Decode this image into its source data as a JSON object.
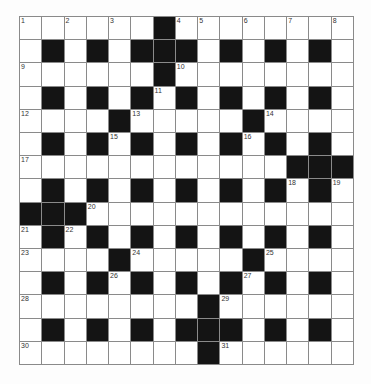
{
  "puzzle": {
    "type": "crossword",
    "rows": 15,
    "cols": 15,
    "colors": {
      "black_cell": "#141414",
      "white_cell": "#ffffff",
      "grid_line": "#8a8a8a",
      "number": "#333333"
    },
    "black_cells": {
      "0": [
        6
      ],
      "1": [
        1,
        3,
        5,
        6,
        7,
        9,
        11,
        13
      ],
      "2": [
        6
      ],
      "3": [
        1,
        3,
        5,
        7,
        9,
        11,
        13
      ],
      "4": [
        4,
        10
      ],
      "5": [
        1,
        3,
        5,
        7,
        9,
        11,
        13
      ],
      "6": [
        12,
        13,
        14
      ],
      "7": [
        1,
        3,
        5,
        7,
        9,
        11,
        13
      ],
      "8": [
        0,
        1,
        2
      ],
      "9": [
        1,
        3,
        5,
        7,
        9,
        11,
        13
      ],
      "10": [
        4,
        10
      ],
      "11": [
        1,
        3,
        5,
        7,
        9,
        11,
        13
      ],
      "12": [
        8
      ],
      "13": [
        1,
        3,
        5,
        7,
        8,
        9,
        11,
        13
      ],
      "14": [
        8
      ]
    },
    "numbers": [
      {
        "n": "1",
        "r": 0,
        "c": 0
      },
      {
        "n": "2",
        "r": 0,
        "c": 2
      },
      {
        "n": "3",
        "r": 0,
        "c": 4
      },
      {
        "n": "4",
        "r": 0,
        "c": 7
      },
      {
        "n": "5",
        "r": 0,
        "c": 8
      },
      {
        "n": "6",
        "r": 0,
        "c": 10
      },
      {
        "n": "7",
        "r": 0,
        "c": 12
      },
      {
        "n": "8",
        "r": 0,
        "c": 14
      },
      {
        "n": "9",
        "r": 2,
        "c": 0
      },
      {
        "n": "10",
        "r": 2,
        "c": 7
      },
      {
        "n": "11",
        "r": 3,
        "c": 6
      },
      {
        "n": "12",
        "r": 4,
        "c": 0
      },
      {
        "n": "13",
        "r": 4,
        "c": 5
      },
      {
        "n": "14",
        "r": 4,
        "c": 11
      },
      {
        "n": "15",
        "r": 5,
        "c": 4
      },
      {
        "n": "16",
        "r": 5,
        "c": 10
      },
      {
        "n": "17",
        "r": 6,
        "c": 0
      },
      {
        "n": "18",
        "r": 7,
        "c": 12
      },
      {
        "n": "19",
        "r": 7,
        "c": 14
      },
      {
        "n": "20",
        "r": 8,
        "c": 3
      },
      {
        "n": "21",
        "r": 9,
        "c": 0
      },
      {
        "n": "22",
        "r": 9,
        "c": 2
      },
      {
        "n": "23",
        "r": 10,
        "c": 0
      },
      {
        "n": "24",
        "r": 10,
        "c": 5
      },
      {
        "n": "25",
        "r": 10,
        "c": 11
      },
      {
        "n": "26",
        "r": 11,
        "c": 4
      },
      {
        "n": "27",
        "r": 11,
        "c": 10
      },
      {
        "n": "28",
        "r": 12,
        "c": 0
      },
      {
        "n": "29",
        "r": 12,
        "c": 9
      },
      {
        "n": "30",
        "r": 14,
        "c": 0
      },
      {
        "n": "31",
        "r": 14,
        "c": 9
      }
    ]
  }
}
